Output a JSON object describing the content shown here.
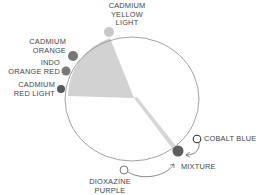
{
  "diagram": {
    "type": "color-wheel-mixing",
    "colors": {
      "wedge_fill": "#d2d2d2",
      "circle_stroke": "#8a8a8a",
      "dot_light": "#c8c8c8",
      "dot_dark": "#707070",
      "mixture_dot": "#5e5e5e",
      "text": "#444444"
    },
    "labels": {
      "cadmium_yellow_light": "CADMIUM\nYELLOW\nLIGHT",
      "cadmium_orange": "CADMIUM\nORANGE",
      "indo_orange_red": "INDO\nORANGE RED",
      "cadmium_red_light": "CADMIUM\nRED LIGHT",
      "cobalt_blue": "COBALT BLUE",
      "mixture": "MIXTURE",
      "dioxazine_purple": "DIOXAZINE\nPURPLE"
    }
  }
}
